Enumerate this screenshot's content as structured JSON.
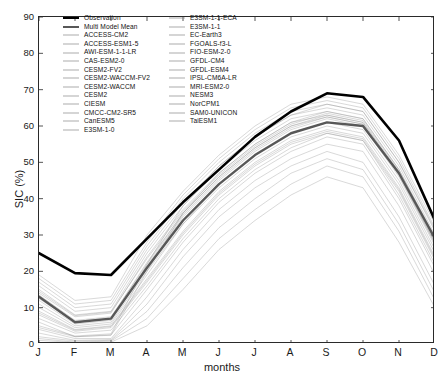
{
  "chart_data": {
    "type": "line",
    "title": "",
    "xlabel": "months",
    "ylabel": "SIC (%)",
    "xlim": [
      0,
      11
    ],
    "ylim": [
      0,
      90
    ],
    "grid": false,
    "legend_position": "top",
    "categories": [
      "J",
      "F",
      "M",
      "A",
      "M",
      "J",
      "J",
      "A",
      "S",
      "O",
      "N",
      "D"
    ],
    "yticks": [
      0,
      10,
      20,
      30,
      40,
      50,
      60,
      70,
      80,
      90
    ],
    "series": [
      {
        "name": "Observation",
        "style": "thick-black",
        "color": "#000000",
        "width": 2.6,
        "alpha": 1.0,
        "values": [
          25.0,
          19.5,
          19.0,
          29.0,
          39.0,
          48.0,
          57.0,
          64.0,
          69.0,
          68.0,
          56.0,
          34.0
        ]
      },
      {
        "name": "Multi Model Mean",
        "style": "thick-gray",
        "color": "#585858",
        "width": 2.4,
        "alpha": 1.0,
        "values": [
          13.0,
          6.0,
          7.0,
          21.0,
          34.0,
          44.0,
          52.0,
          58.0,
          61.0,
          60.0,
          47.0,
          29.0
        ]
      },
      {
        "name": "ACCESS-CM2",
        "color": "#8a8a8a",
        "width": 0.55,
        "alpha": 0.6,
        "values": [
          14.0,
          7.5,
          8.5,
          24.0,
          37.0,
          47.0,
          55.0,
          61.0,
          63.0,
          61.0,
          47.0,
          28.0
        ]
      },
      {
        "name": "ACCESS-ESM1-5",
        "color": "#8a8a8a",
        "width": 0.55,
        "alpha": 0.6,
        "values": [
          11.0,
          5.0,
          6.0,
          20.0,
          33.0,
          43.0,
          51.0,
          57.0,
          60.0,
          58.0,
          44.0,
          25.0
        ]
      },
      {
        "name": "AWI-ESM-1-1-LR",
        "color": "#8a8a8a",
        "width": 0.55,
        "alpha": 0.6,
        "values": [
          16.0,
          9.0,
          10.0,
          26.0,
          39.0,
          49.0,
          57.0,
          63.0,
          65.0,
          63.0,
          49.0,
          30.0
        ]
      },
      {
        "name": "CAS-ESM2-0",
        "color": "#8a8a8a",
        "width": 0.55,
        "alpha": 0.6,
        "values": [
          4.0,
          1.5,
          1.5,
          13.0,
          26.0,
          37.0,
          45.0,
          51.0,
          55.0,
          53.0,
          38.0,
          19.0
        ]
      },
      {
        "name": "CESM2-FV2",
        "color": "#8a8a8a",
        "width": 0.55,
        "alpha": 0.6,
        "values": [
          12.0,
          5.5,
          6.5,
          21.0,
          35.0,
          45.0,
          53.0,
          59.0,
          62.0,
          60.0,
          46.0,
          27.0
        ]
      },
      {
        "name": "CESM2-WACCM-FV2",
        "color": "#8a8a8a",
        "width": 0.55,
        "alpha": 0.6,
        "values": [
          10.0,
          4.5,
          5.5,
          19.0,
          33.0,
          44.0,
          52.0,
          58.0,
          61.0,
          59.0,
          45.0,
          26.0
        ]
      },
      {
        "name": "CESM2-WACCM",
        "color": "#8a8a8a",
        "width": 0.55,
        "alpha": 0.6,
        "values": [
          13.5,
          6.5,
          7.5,
          22.0,
          36.0,
          46.0,
          54.0,
          60.0,
          63.0,
          61.0,
          47.0,
          28.5
        ]
      },
      {
        "name": "CESM2",
        "color": "#8a8a8a",
        "width": 0.55,
        "alpha": 0.6,
        "values": [
          12.5,
          6.0,
          7.0,
          21.5,
          35.5,
          45.5,
          53.5,
          59.5,
          62.5,
          60.5,
          46.5,
          27.5
        ]
      },
      {
        "name": "CIESM",
        "color": "#8a8a8a",
        "width": 0.55,
        "alpha": 0.6,
        "values": [
          6.0,
          2.0,
          2.5,
          15.0,
          28.0,
          39.0,
          47.0,
          53.0,
          57.0,
          55.0,
          40.0,
          21.0
        ]
      },
      {
        "name": "CMCC-CM2-SR5",
        "color": "#8a8a8a",
        "width": 0.55,
        "alpha": 0.6,
        "values": [
          15.0,
          8.0,
          9.0,
          25.0,
          38.0,
          48.0,
          56.0,
          62.0,
          64.0,
          62.0,
          48.0,
          29.0
        ]
      },
      {
        "name": "CanESM5",
        "color": "#8a8a8a",
        "width": 0.55,
        "alpha": 0.6,
        "values": [
          2.0,
          0.8,
          1.0,
          9.0,
          21.0,
          32.0,
          40.0,
          47.0,
          51.0,
          48.0,
          33.0,
          14.0
        ]
      },
      {
        "name": "E3SM-1-0",
        "color": "#8a8a8a",
        "width": 0.55,
        "alpha": 0.6,
        "values": [
          9.0,
          4.0,
          5.0,
          18.0,
          31.0,
          42.0,
          50.0,
          56.0,
          59.0,
          57.0,
          43.0,
          24.0
        ]
      },
      {
        "name": "E3SM-1-1-ECA",
        "color": "#8a8a8a",
        "width": 0.55,
        "alpha": 0.6,
        "values": [
          8.0,
          3.5,
          4.5,
          17.0,
          30.0,
          41.0,
          49.0,
          55.0,
          58.0,
          56.0,
          42.0,
          23.0
        ]
      },
      {
        "name": "E3SM-1-1",
        "color": "#8a8a8a",
        "width": 0.55,
        "alpha": 0.6,
        "values": [
          8.5,
          3.8,
          4.8,
          17.5,
          30.5,
          41.5,
          49.5,
          55.5,
          58.5,
          56.5,
          42.5,
          23.5
        ]
      },
      {
        "name": "EC-Earth3",
        "color": "#8a8a8a",
        "width": 0.55,
        "alpha": 0.6,
        "values": [
          17.0,
          10.0,
          11.0,
          27.0,
          40.0,
          50.0,
          58.0,
          64.0,
          66.0,
          64.0,
          50.0,
          31.0
        ]
      },
      {
        "name": "FGOALS-f3-L",
        "color": "#8a8a8a",
        "width": 0.55,
        "alpha": 0.6,
        "values": [
          3.0,
          1.0,
          1.2,
          11.0,
          24.0,
          35.0,
          43.0,
          49.0,
          53.0,
          50.0,
          35.0,
          16.0
        ]
      },
      {
        "name": "FIO-ESM-2-0",
        "color": "#8a8a8a",
        "width": 0.55,
        "alpha": 0.6,
        "values": [
          14.5,
          7.8,
          8.8,
          23.5,
          36.5,
          46.5,
          54.5,
          60.5,
          63.5,
          61.5,
          47.5,
          28.8
        ]
      },
      {
        "name": "GFDL-CM4",
        "color": "#8a8a8a",
        "width": 0.55,
        "alpha": 0.6,
        "values": [
          5.0,
          2.2,
          2.8,
          22.0,
          38.0,
          49.0,
          57.0,
          63.0,
          66.0,
          64.0,
          50.0,
          31.5
        ]
      },
      {
        "name": "GFDL-ESM4",
        "color": "#8a8a8a",
        "width": 0.55,
        "alpha": 0.6,
        "values": [
          4.5,
          2.0,
          2.4,
          20.0,
          36.0,
          47.0,
          55.0,
          61.0,
          64.0,
          62.0,
          48.0,
          29.5
        ]
      },
      {
        "name": "IPSL-CM6A-LR",
        "color": "#8a8a8a",
        "width": 0.55,
        "alpha": 0.6,
        "values": [
          18.0,
          11.0,
          12.0,
          28.0,
          41.0,
          51.0,
          59.0,
          65.0,
          67.0,
          65.0,
          51.0,
          32.0
        ]
      },
      {
        "name": "MRI-ESM2-0",
        "color": "#8a8a8a",
        "width": 0.55,
        "alpha": 0.6,
        "values": [
          7.0,
          3.0,
          3.8,
          16.0,
          29.0,
          40.0,
          48.0,
          54.0,
          58.0,
          56.0,
          41.0,
          22.0
        ]
      },
      {
        "name": "NESM3",
        "color": "#8a8a8a",
        "width": 0.55,
        "alpha": 0.6,
        "values": [
          1.5,
          0.5,
          0.8,
          7.0,
          18.0,
          29.0,
          37.0,
          44.0,
          49.0,
          46.0,
          31.0,
          12.0
        ]
      },
      {
        "name": "NorCPM1",
        "color": "#8a8a8a",
        "width": 0.55,
        "alpha": 0.6,
        "values": [
          19.0,
          12.0,
          13.0,
          30.0,
          42.0,
          52.0,
          60.0,
          66.0,
          68.0,
          66.0,
          52.0,
          33.0
        ]
      },
      {
        "name": "SAM0-UNICON",
        "color": "#8a8a8a",
        "width": 0.55,
        "alpha": 0.6,
        "values": [
          1.0,
          0.4,
          0.5,
          5.0,
          15.0,
          26.0,
          34.0,
          41.0,
          46.0,
          43.0,
          28.0,
          10.0
        ]
      },
      {
        "name": "TaiESM1",
        "color": "#8a8a8a",
        "width": 0.55,
        "alpha": 0.6,
        "values": [
          13.0,
          6.2,
          7.2,
          22.5,
          36.0,
          46.0,
          54.0,
          60.0,
          62.5,
          60.5,
          46.5,
          27.8
        ]
      }
    ]
  },
  "legend": {
    "columns": [
      [
        {
          "label": "Observation",
          "swatch": "thick-black"
        },
        {
          "label": "Multi Model Mean",
          "swatch": "thick-gray"
        },
        {
          "label": "ACCESS-CM2",
          "swatch": "thin"
        },
        {
          "label": "ACCESS-ESM1-5",
          "swatch": "thin"
        },
        {
          "label": "AWI-ESM-1-1-LR",
          "swatch": "thin"
        },
        {
          "label": "CAS-ESM2-0",
          "swatch": "thin"
        },
        {
          "label": "CESM2-FV2",
          "swatch": "thin"
        },
        {
          "label": "CESM2-WACCM-FV2",
          "swatch": "thin"
        },
        {
          "label": "CESM2-WACCM",
          "swatch": "thin"
        },
        {
          "label": "CESM2",
          "swatch": "thin"
        },
        {
          "label": "CIESM",
          "swatch": "thin"
        },
        {
          "label": "CMCC-CM2-SR5",
          "swatch": "thin"
        },
        {
          "label": "CanESM5",
          "swatch": "thin"
        },
        {
          "label": "E3SM-1-0",
          "swatch": "thin"
        }
      ],
      [
        {
          "label": "E3SM-1-1-ECA",
          "swatch": "thin"
        },
        {
          "label": "E3SM-1-1",
          "swatch": "thin"
        },
        {
          "label": "EC-Earth3",
          "swatch": "thin"
        },
        {
          "label": "FGOALS-f3-L",
          "swatch": "thin"
        },
        {
          "label": "FIO-ESM-2-0",
          "swatch": "thin"
        },
        {
          "label": "GFDL-CM4",
          "swatch": "thin"
        },
        {
          "label": "GFDL-ESM4",
          "swatch": "thin"
        },
        {
          "label": "IPSL-CM6A-LR",
          "swatch": "thin"
        },
        {
          "label": "MRI-ESM2-0",
          "swatch": "thin"
        },
        {
          "label": "NESM3",
          "swatch": "thin"
        },
        {
          "label": "NorCPM1",
          "swatch": "thin"
        },
        {
          "label": "SAM0-UNICON",
          "swatch": "thin"
        },
        {
          "label": "TaiESM1",
          "swatch": "thin"
        }
      ]
    ]
  },
  "colors": {
    "observation": "#000000",
    "multi_model_mean": "#585858",
    "model_lines": "#8a8a8a",
    "axis": "#2a2a2a"
  }
}
